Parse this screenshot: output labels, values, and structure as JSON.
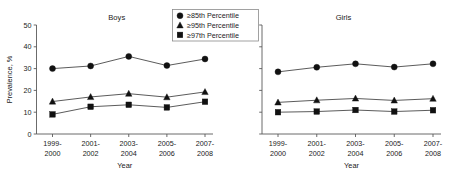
{
  "chart_data": {
    "type": "line",
    "title": "",
    "panels": [
      {
        "title": "Boys",
        "xlabel": "Year",
        "ylabel": "Prevalence, %",
        "categories": [
          "1999-2000",
          "2001-2002",
          "2003-2004",
          "2005-2006",
          "2007-2008"
        ],
        "ylim": [
          0,
          50
        ],
        "yticks": [
          0,
          10,
          20,
          30,
          40,
          50
        ],
        "grid": false,
        "series": [
          {
            "name": "≥85th Percentile",
            "marker": "circle",
            "values": [
              30.0,
              31.2,
              35.6,
              31.4,
              34.4
            ]
          },
          {
            "name": "≥95th Percentile",
            "marker": "triangle",
            "values": [
              14.9,
              17.0,
              18.5,
              16.9,
              19.3
            ]
          },
          {
            "name": "≥97th Percentile",
            "marker": "square",
            "values": [
              9.0,
              12.5,
              13.4,
              12.2,
              14.8
            ]
          }
        ]
      },
      {
        "title": "Girls",
        "xlabel": "Year",
        "ylabel": "",
        "categories": [
          "1999-2000",
          "2001-2002",
          "2003-2004",
          "2005-2006",
          "2007-2008"
        ],
        "ylim": [
          0,
          50
        ],
        "yticks": [
          0,
          10,
          20,
          30,
          40,
          50
        ],
        "grid": false,
        "series": [
          {
            "name": "≥85th Percentile",
            "marker": "circle",
            "values": [
              28.5,
              30.6,
              32.2,
              30.7,
              32.2
            ]
          },
          {
            "name": "≥95th Percentile",
            "marker": "triangle",
            "values": [
              14.5,
              15.5,
              16.3,
              15.4,
              16.2
            ]
          },
          {
            "name": "≥97th Percentile",
            "marker": "square",
            "values": [
              10.0,
              10.3,
              11.0,
              10.3,
              10.9
            ]
          }
        ]
      }
    ],
    "legend": {
      "position": "top-center",
      "entries": [
        {
          "label": "≥85th Percentile",
          "marker": "circle"
        },
        {
          "label": "≥95th Percentile",
          "marker": "triangle"
        },
        {
          "label": "≥97th Percentile",
          "marker": "square"
        }
      ]
    },
    "colors": {
      "line": "#3d3d3d",
      "marker": "#111111",
      "axis": "#5a5a5a",
      "text": "#1a1a1a",
      "background": "#ffffff"
    }
  }
}
